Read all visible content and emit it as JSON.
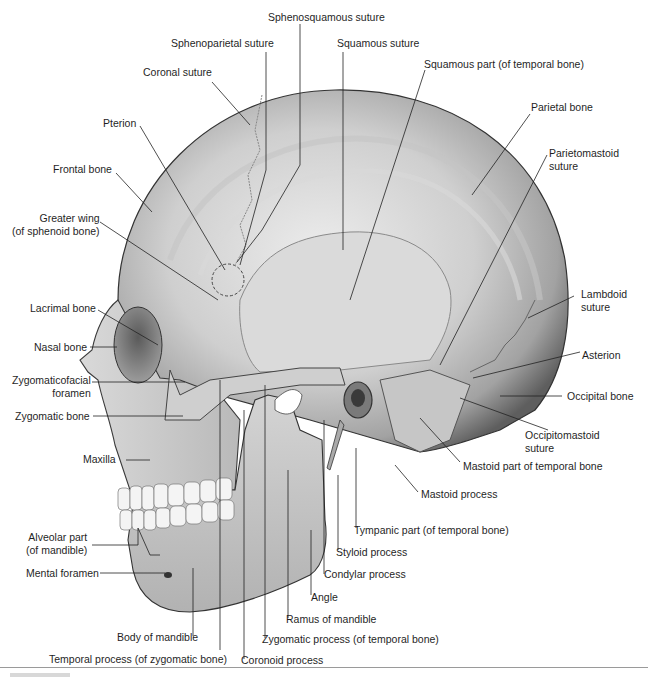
{
  "figure": {
    "colors": {
      "bone_light": "#e6e6e6",
      "bone_mid": "#bdbdbd",
      "bone_dark": "#6e6e6e",
      "outline": "#3a3a3a",
      "leader": "#222222",
      "rule": "#9a9a9a"
    }
  },
  "labels": {
    "sphenosquamous_suture": "Sphenosquamous suture",
    "sphenoparietal_suture": "Sphenoparietal suture",
    "squamous_suture": "Squamous suture",
    "coronal_suture": "Coronal suture",
    "squamous_part": "Squamous part (of temporal bone)",
    "pterion": "Pterion",
    "parietal_bone": "Parietal bone",
    "parietomastoid_suture_1": "Parietomastoid",
    "parietomastoid_suture_2": "suture",
    "frontal_bone": "Frontal bone",
    "greater_wing_1": "Greater wing",
    "greater_wing_2": "(of sphenoid bone)",
    "lambdoid_suture_1": "Lambdoid",
    "lambdoid_suture_2": "suture",
    "lacrimal_bone": "Lacrimal bone",
    "nasal_bone": "Nasal bone",
    "asterion": "Asterion",
    "zygomaticofacial_foramen_1": "Zygomaticofacial",
    "zygomaticofacial_foramen_2": "foramen",
    "occipital_bone": "Occipital bone",
    "zygomatic_bone": "Zygomatic bone",
    "occipitomastoid_suture_1": "Occipitomastoid",
    "occipitomastoid_suture_2": "suture",
    "maxilla": "Maxilla",
    "mastoid_part": "Mastoid part of temporal bone",
    "mastoid_process": "Mastoid process",
    "alveolar_part_1": "Alveolar part",
    "alveolar_part_2": "(of mandible)",
    "tympanic_part": "Tympanic part (of temporal bone)",
    "styloid_process": "Styloid process",
    "mental_foramen": "Mental foramen",
    "condylar_process": "Condylar process",
    "angle": "Angle",
    "ramus_of_mandible": "Ramus of mandible",
    "body_of_mandible": "Body of mandible",
    "zygomatic_process": "Zygomatic process (of temporal bone)",
    "temporal_process": "Temporal process (of zygomatic bone)",
    "coronoid_process": "Coronoid process"
  }
}
